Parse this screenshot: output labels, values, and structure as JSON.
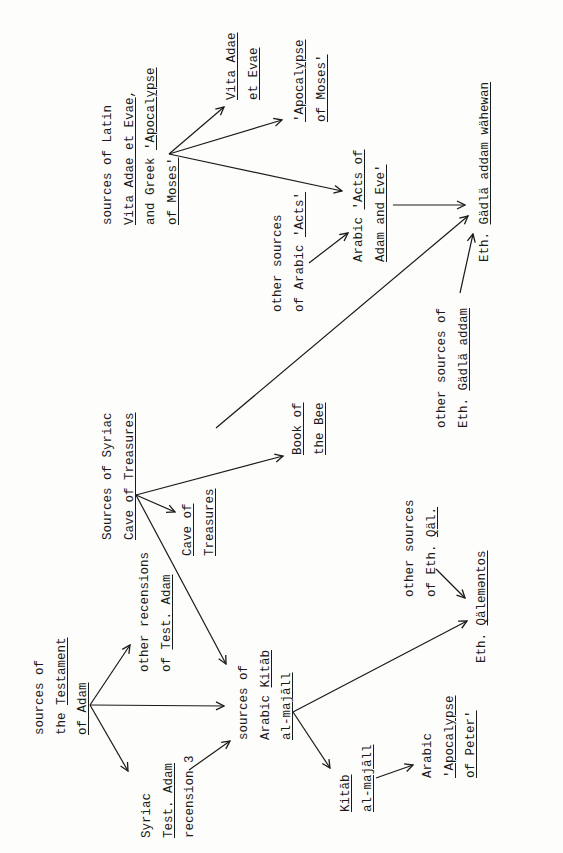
{
  "diagram": {
    "orientation": "rotated 90deg counter-clockwise (landscape page)",
    "line_color": "#1a1a1a",
    "background": "#fdfdfb",
    "nodes": [
      {
        "id": "testament_sources",
        "x": 30,
        "y": 735,
        "lines": [
          {
            "parts": [
              {
                "t": "sources of",
                "u": false
              }
            ]
          },
          {
            "parts": [
              {
                "t": "the ",
                "u": false
              },
              {
                "t": "Testament",
                "u": true
              }
            ]
          },
          {
            "parts": [
              {
                "t": "of Adam",
                "u": true
              }
            ]
          }
        ]
      },
      {
        "id": "syriac_test_adam",
        "x": 137,
        "y": 838,
        "lines": [
          {
            "parts": [
              {
                "t": "Syriac",
                "u": false
              }
            ]
          },
          {
            "parts": [
              {
                "t": "Test. Adam",
                "u": true
              }
            ]
          },
          {
            "parts": [
              {
                "t": "recension 3",
                "u": false
              }
            ]
          }
        ]
      },
      {
        "id": "other_recensions",
        "x": 135,
        "y": 672,
        "lines": [
          {
            "parts": [
              {
                "t": "other recensions",
                "u": false
              }
            ]
          },
          {
            "parts": [
              {
                "t": "of ",
                "u": false
              },
              {
                "t": "Test. Adam",
                "u": true
              }
            ]
          }
        ]
      },
      {
        "id": "kitab_majall_sources",
        "x": 234,
        "y": 740,
        "lines": [
          {
            "parts": [
              {
                "t": "sources of",
                "u": false
              }
            ]
          },
          {
            "parts": [
              {
                "t": "Arabic ",
                "u": false
              },
              {
                "t": "Kitāb",
                "u": true
              }
            ]
          },
          {
            "parts": [
              {
                "t": "al-majāll",
                "u": true
              }
            ]
          }
        ]
      },
      {
        "id": "kitab_majall",
        "x": 336,
        "y": 812,
        "lines": [
          {
            "parts": [
              {
                "t": "Kitāb",
                "u": true
              }
            ]
          },
          {
            "parts": [
              {
                "t": "al-majāll",
                "u": true
              }
            ]
          }
        ]
      },
      {
        "id": "arabic_apoc_peter",
        "x": 418,
        "y": 778,
        "lines": [
          {
            "parts": [
              {
                "t": "Arabic",
                "u": false
              }
            ]
          },
          {
            "parts": [
              {
                "t": "'Apocalypse",
                "u": true
              }
            ]
          },
          {
            "parts": [
              {
                "t": "of Peter'",
                "u": true
              }
            ]
          }
        ]
      },
      {
        "id": "syriac_cave_sources",
        "x": 98,
        "y": 540,
        "lines": [
          {
            "parts": [
              {
                "t": "Sources of Syriac",
                "u": false
              }
            ]
          },
          {
            "parts": [
              {
                "t": "Cave of Treasures",
                "u": true
              }
            ]
          }
        ]
      },
      {
        "id": "cave_of_treasures",
        "x": 178,
        "y": 556,
        "lines": [
          {
            "parts": [
              {
                "t": "Cave of",
                "u": true
              }
            ]
          },
          {
            "parts": [
              {
                "t": "Treasures",
                "u": true
              }
            ]
          }
        ]
      },
      {
        "id": "book_of_bee",
        "x": 288,
        "y": 455,
        "lines": [
          {
            "parts": [
              {
                "t": "Book of",
                "u": true
              }
            ]
          },
          {
            "parts": [
              {
                "t": "the Bee",
                "u": true
              }
            ]
          }
        ]
      },
      {
        "id": "other_sources_eth_qal",
        "x": 400,
        "y": 597,
        "lines": [
          {
            "parts": [
              {
                "t": "other sources",
                "u": false
              }
            ]
          },
          {
            "parts": [
              {
                "t": "of Eth. ",
                "u": false
              },
              {
                "t": "Qäl.",
                "u": true
              }
            ]
          }
        ]
      },
      {
        "id": "eth_qalementos",
        "x": 472,
        "y": 663,
        "lines": [
          {
            "parts": [
              {
                "t": "Eth. ",
                "u": false
              },
              {
                "t": "Qälemәntos",
                "u": true
              }
            ]
          }
        ]
      },
      {
        "id": "latin_vita_sources",
        "x": 98,
        "y": 225,
        "lines": [
          {
            "parts": [
              {
                "t": "sources of Latin",
                "u": false
              }
            ]
          },
          {
            "parts": [
              {
                "t": "Vita Adae et Evae",
                "u": true
              },
              {
                "t": ",",
                "u": false
              }
            ]
          },
          {
            "parts": [
              {
                "t": "and Greek ",
                "u": false
              },
              {
                "t": "'Apocalypse",
                "u": true
              }
            ]
          },
          {
            "parts": [
              {
                "t": "of Moses'",
                "u": true
              }
            ]
          }
        ]
      },
      {
        "id": "vita_adae",
        "x": 222,
        "y": 100,
        "lines": [
          {
            "parts": [
              {
                "t": "Vita Adae",
                "u": true
              }
            ]
          },
          {
            "parts": [
              {
                "t": "et Evae",
                "u": true
              }
            ]
          }
        ]
      },
      {
        "id": "apoc_moses",
        "x": 290,
        "y": 122,
        "lines": [
          {
            "parts": [
              {
                "t": "'Apocalypse",
                "u": true
              }
            ]
          },
          {
            "parts": [
              {
                "t": "of Moses'",
                "u": true
              }
            ]
          }
        ]
      },
      {
        "id": "other_sources_arabic_acts",
        "x": 268,
        "y": 312,
        "lines": [
          {
            "parts": [
              {
                "t": "other sources",
                "u": false
              }
            ]
          },
          {
            "parts": [
              {
                "t": "of Arabic ",
                "u": false
              },
              {
                "t": "'Acts'",
                "u": true
              }
            ]
          }
        ]
      },
      {
        "id": "arabic_acts",
        "x": 349,
        "y": 262,
        "lines": [
          {
            "parts": [
              {
                "t": "Arabic ",
                "u": false
              },
              {
                "t": "'Acts of",
                "u": true
              }
            ]
          },
          {
            "parts": [
              {
                "t": "Adam and Eve'",
                "u": true
              }
            ]
          }
        ]
      },
      {
        "id": "other_sources_gadla",
        "x": 432,
        "y": 428,
        "lines": [
          {
            "parts": [
              {
                "t": "other sources of",
                "u": false
              }
            ]
          },
          {
            "parts": [
              {
                "t": "Eth. ",
                "u": false
              },
              {
                "t": "Gädlä addam",
                "u": true
              }
            ]
          }
        ]
      },
      {
        "id": "eth_gadla",
        "x": 475,
        "y": 262,
        "lines": [
          {
            "parts": [
              {
                "t": "Eth. ",
                "u": false
              },
              {
                "t": "Gädlä addam wähewan",
                "u": true
              }
            ]
          }
        ]
      }
    ],
    "edges": [
      {
        "from": "testament_sources",
        "to": "other_recensions",
        "x1": 90,
        "y1": 705,
        "x2": 130,
        "y2": 645
      },
      {
        "from": "testament_sources",
        "to": "kitab_majall_sources",
        "x1": 90,
        "y1": 705,
        "x2": 224,
        "y2": 706
      },
      {
        "from": "testament_sources",
        "to": "syriac_test_adam",
        "x1": 90,
        "y1": 705,
        "x2": 128,
        "y2": 771
      },
      {
        "from": "syriac_test_adam",
        "to": "kitab_majall_sources",
        "x1": 189,
        "y1": 770,
        "x2": 230,
        "y2": 741
      },
      {
        "from": "syriac_cave_sources",
        "to": "kitab_majall_sources",
        "x1": 136,
        "y1": 495,
        "x2": 226,
        "y2": 664
      },
      {
        "from": "syriac_cave_sources",
        "to": "cave_of_treasures",
        "x1": 136,
        "y1": 495,
        "x2": 175,
        "y2": 512
      },
      {
        "from": "syriac_cave_sources",
        "to": "book_of_bee",
        "x1": 136,
        "y1": 495,
        "x2": 283,
        "y2": 456
      },
      {
        "from": "syriac_cave_sources",
        "to": "eth_gadla",
        "x1": 216,
        "y1": 428,
        "x2": 468,
        "y2": 216
      },
      {
        "from": "kitab_majall_sources",
        "to": "eth_qalementos",
        "x1": 293,
        "y1": 712,
        "x2": 467,
        "y2": 621
      },
      {
        "from": "kitab_majall_sources",
        "to": "kitab_majall",
        "x1": 293,
        "y1": 712,
        "x2": 330,
        "y2": 768
      },
      {
        "from": "kitab_majall",
        "to": "arabic_apoc_peter",
        "x1": 376,
        "y1": 778,
        "x2": 413,
        "y2": 765
      },
      {
        "from": "other_sources_eth_qal",
        "to": "eth_qalementos",
        "x1": 436,
        "y1": 569,
        "x2": 465,
        "y2": 598
      },
      {
        "from": "latin_vita_sources",
        "to": "vita_adae",
        "x1": 169,
        "y1": 154,
        "x2": 224,
        "y2": 107
      },
      {
        "from": "latin_vita_sources",
        "to": "apoc_moses",
        "x1": 169,
        "y1": 154,
        "x2": 282,
        "y2": 120
      },
      {
        "from": "latin_vita_sources",
        "to": "arabic_acts",
        "x1": 169,
        "y1": 154,
        "x2": 342,
        "y2": 191
      },
      {
        "from": "other_sources_arabic_acts",
        "to": "arabic_acts",
        "x1": 309,
        "y1": 263,
        "x2": 348,
        "y2": 233
      },
      {
        "from": "arabic_acts",
        "to": "eth_gadla",
        "x1": 393,
        "y1": 205,
        "x2": 465,
        "y2": 205
      },
      {
        "from": "other_sources_gadla",
        "to": "eth_gadla",
        "x1": 460,
        "y1": 293,
        "x2": 473,
        "y2": 234
      }
    ]
  }
}
